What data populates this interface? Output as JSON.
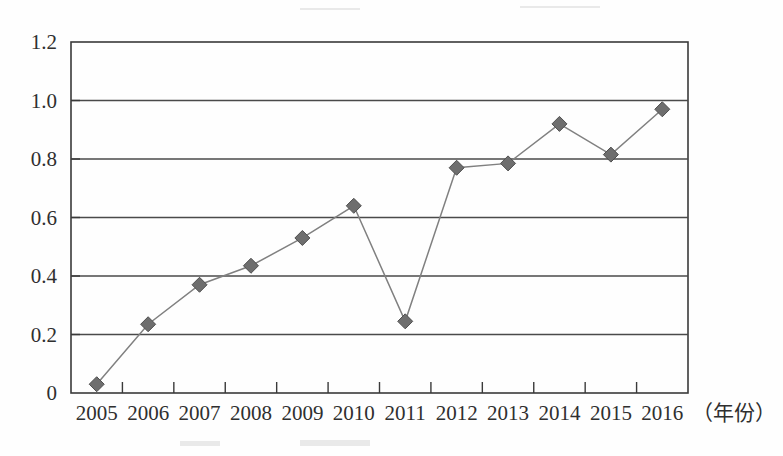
{
  "chart_data": {
    "type": "line",
    "title": "",
    "subtitle": "",
    "xlabel": "（年份）",
    "ylabel": "",
    "categories": [
      "2005",
      "2006",
      "2007",
      "2008",
      "2009",
      "2010",
      "2011",
      "2012",
      "2013",
      "2014",
      "2015",
      "2016"
    ],
    "x": [
      2005,
      2006,
      2007,
      2008,
      2009,
      2010,
      2011,
      2012,
      2013,
      2014,
      2015,
      2016
    ],
    "values": [
      0.03,
      0.235,
      0.37,
      0.435,
      0.53,
      0.64,
      0.245,
      0.77,
      0.785,
      0.92,
      0.815,
      0.97
    ],
    "series": [
      {
        "name": "series-1",
        "values": [
          0.03,
          0.235,
          0.37,
          0.435,
          0.53,
          0.64,
          0.245,
          0.77,
          0.785,
          0.92,
          0.815,
          0.97
        ],
        "marker": "diamond",
        "marker_color": "#6e6e6e",
        "line_color": "#808080"
      }
    ],
    "ylim": [
      0,
      1.2
    ],
    "ytick_values": [
      0,
      0.2,
      0.4,
      0.6,
      0.8,
      1.0,
      1.2
    ],
    "ytick_labels": [
      "0",
      "0.2",
      "0.4",
      "0.6",
      "0.8",
      "1.0",
      "1.2"
    ],
    "xtick_labels": [
      "2005",
      "2006",
      "2007",
      "2008",
      "2009",
      "2010",
      "2011",
      "2012",
      "2013",
      "2014",
      "2015",
      "2016"
    ],
    "grid": {
      "horizontal": true,
      "vertical": false
    },
    "legend": {
      "visible": false,
      "position": "none",
      "entries": []
    },
    "annotations": [],
    "colors": {
      "line": "#808080",
      "marker": "#6e6e6e",
      "axis": "#3a3a3a",
      "grid": "#4a4a4a",
      "background": "#fefefe",
      "text": "#2f2f2f"
    }
  },
  "axes": {
    "y_labels": [
      "1.2",
      "1.0",
      "0.8",
      "0.6",
      "0.4",
      "0.2",
      "0"
    ],
    "x_labels": [
      "2005",
      "2006",
      "2007",
      "2008",
      "2009",
      "2010",
      "2011",
      "2012",
      "2013",
      "2014",
      "2015",
      "2016"
    ],
    "x_unit": "（年份）"
  },
  "caption": {
    "text": ""
  }
}
